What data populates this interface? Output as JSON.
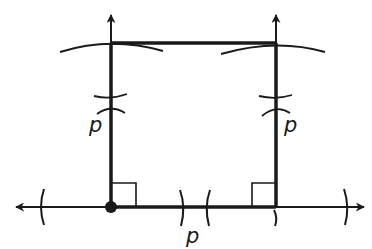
{
  "diagram": {
    "stroke_color": "#1a1a1a",
    "background": "#ffffff",
    "labels": {
      "left_side": "p",
      "right_side": "p",
      "bottom_segment": "p"
    },
    "elements": {
      "baseline": "horizontal line with arrows at both ends",
      "left_perpendicular": "vertical line with arrow at top",
      "right_perpendicular": "vertical line with arrow at top",
      "square": "square with side length p",
      "right_angle_marks": 2,
      "intersection_x_marks": 2,
      "compass_arcs": 6,
      "point": "filled dot at bottom-left vertex"
    }
  }
}
